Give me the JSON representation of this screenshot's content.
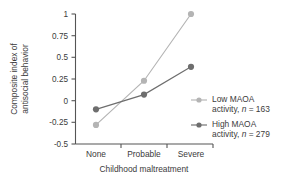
{
  "chart_data": {
    "type": "line",
    "title": "",
    "subtitle": "",
    "xlabel": "Childhood maltreatment",
    "ylabel_line1": "Composite index of",
    "ylabel_line2": "antisocial behavior",
    "categories": [
      "None",
      "Probable",
      "Severe"
    ],
    "ylim": [
      -0.5,
      1
    ],
    "yticks": [
      1,
      0.75,
      0.5,
      0.25,
      0,
      -0.25,
      -0.5
    ],
    "ytick_labels": [
      "1",
      "0.75",
      "0.5",
      "0.25",
      "0",
      "-0.25",
      "-0.5"
    ],
    "grid": false,
    "legend_position": "right",
    "series": [
      {
        "name": "Low MAOA activity",
        "legend_line1": "Low MAOA",
        "legend_line2_prefix": "activity, ",
        "legend_line2_italic": "n",
        "legend_line2_suffix": " = 163",
        "n": 163,
        "color": "#b4b4b4",
        "values": [
          -0.28,
          0.23,
          1.0
        ]
      },
      {
        "name": "High MAOA activity",
        "legend_line1": "High MAOA",
        "legend_line2_prefix": "activity, ",
        "legend_line2_italic": "n",
        "legend_line2_suffix": " = 279",
        "n": 279,
        "color": "#6e6e6e",
        "values": [
          -0.1,
          0.07,
          0.39
        ]
      }
    ]
  }
}
